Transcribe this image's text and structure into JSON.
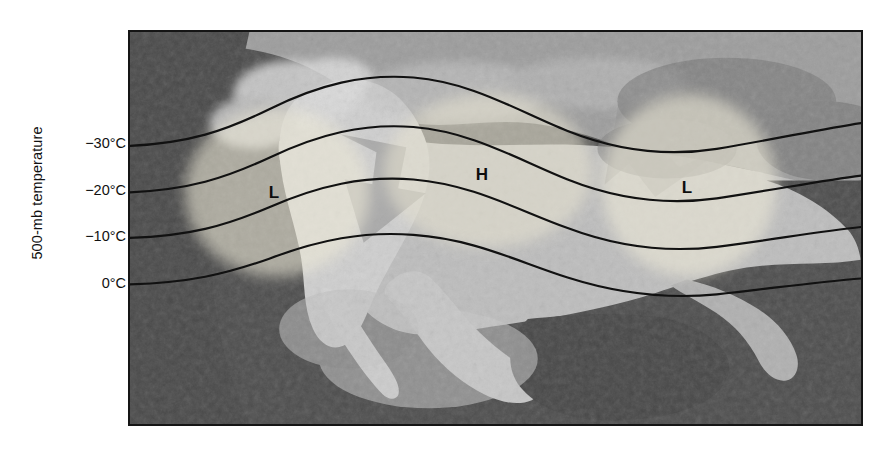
{
  "figure": {
    "y_axis_title": "500-mb temperature",
    "map_alt": "grayscale satellite view of North America"
  },
  "axis": {
    "ticks": [
      {
        "label": "−30°C",
        "y": 145
      },
      {
        "label": "−20°C",
        "y": 192
      },
      {
        "label": "−10°C",
        "y": 238
      },
      {
        "label": "0°C",
        "y": 285
      }
    ]
  },
  "systems": [
    {
      "name": "low-west",
      "label": "L",
      "x": 272,
      "y": 190
    },
    {
      "name": "high-center",
      "label": "H",
      "x": 480,
      "y": 172
    },
    {
      "name": "low-east",
      "label": "L",
      "x": 685,
      "y": 185
    }
  ],
  "colors": {
    "contour_line": "#111111",
    "frame": "#151515",
    "ocean": "#4b4b4b",
    "land": "#b9b9b9",
    "blob_highlight": "#e3e0cf",
    "arrow": "#8d8d8d",
    "text": "#111111",
    "background": "#ffffff"
  },
  "chart_data": {
    "type": "line",
    "title": "",
    "xlabel": "",
    "ylabel": "500-mb temperature",
    "ytick_labels": [
      "−30°C",
      "−20°C",
      "−10°C",
      "0°C"
    ],
    "ytick_values": [
      -30,
      -20,
      -10,
      0
    ],
    "grid": false,
    "legend": "none",
    "annotations": [
      "L",
      "H",
      "L"
    ],
    "series": [
      {
        "name": "−30°C isotherm",
        "amplitude": 57,
        "base_y": 145,
        "points": [
          [
            0,
            145
          ],
          [
            46,
            141
          ],
          [
            92,
            130
          ],
          [
            138,
            115
          ],
          [
            184,
            98
          ],
          [
            230,
            85
          ],
          [
            276,
            78
          ],
          [
            322,
            76
          ],
          [
            368,
            81
          ],
          [
            414,
            91
          ],
          [
            460,
            101
          ],
          [
            506,
            107
          ],
          [
            552,
            109
          ],
          [
            598,
            105
          ],
          [
            644,
            99
          ],
          [
            690,
            95
          ],
          [
            735,
            93
          ]
        ]
      },
      {
        "name": "−20°C isotherm",
        "amplitude": 54,
        "base_y": 192,
        "points": [
          [
            0,
            192
          ],
          [
            46,
            189
          ],
          [
            92,
            179
          ],
          [
            138,
            165
          ],
          [
            184,
            149
          ],
          [
            230,
            137
          ],
          [
            276,
            130
          ],
          [
            322,
            128
          ],
          [
            368,
            133
          ],
          [
            414,
            143
          ],
          [
            460,
            152
          ],
          [
            506,
            159
          ],
          [
            552,
            161
          ],
          [
            598,
            157
          ],
          [
            644,
            151
          ],
          [
            690,
            147
          ],
          [
            735,
            145
          ]
        ]
      },
      {
        "name": "−10°C isotherm",
        "amplitude": 48,
        "base_y": 238,
        "points": [
          [
            0,
            238
          ],
          [
            46,
            236
          ],
          [
            92,
            227
          ],
          [
            138,
            214
          ],
          [
            184,
            200
          ],
          [
            230,
            189
          ],
          [
            276,
            183
          ],
          [
            322,
            182
          ],
          [
            368,
            186
          ],
          [
            414,
            195
          ],
          [
            460,
            204
          ],
          [
            506,
            210
          ],
          [
            552,
            212
          ],
          [
            598,
            209
          ],
          [
            644,
            203
          ],
          [
            690,
            199
          ],
          [
            735,
            197
          ]
        ]
      },
      {
        "name": "0°C isotherm",
        "amplitude": 41,
        "base_y": 285,
        "points": [
          [
            0,
            285
          ],
          [
            46,
            283
          ],
          [
            92,
            276
          ],
          [
            138,
            265
          ],
          [
            184,
            253
          ],
          [
            230,
            243
          ],
          [
            276,
            238
          ],
          [
            322,
            237
          ],
          [
            368,
            241
          ],
          [
            414,
            249
          ],
          [
            460,
            256
          ],
          [
            506,
            262
          ],
          [
            552,
            264
          ],
          [
            598,
            261
          ],
          [
            644,
            256
          ],
          [
            690,
            252
          ],
          [
            735,
            250
          ]
        ]
      }
    ]
  }
}
